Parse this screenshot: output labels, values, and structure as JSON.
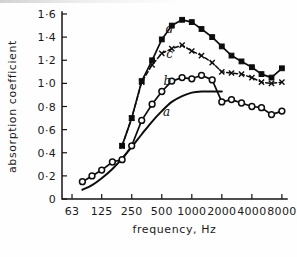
{
  "chart_data": {
    "type": "line",
    "title": "",
    "xlabel": "frequency, Hz",
    "ylabel": "absorption coefficient",
    "xscale": "log",
    "xlim": [
      50,
      9000
    ],
    "ylim": [
      0,
      1.6
    ],
    "grid": false,
    "legend": "inline-curve-labels",
    "xticks": [
      63,
      125,
      250,
      500,
      1000,
      2000,
      4000,
      8000
    ],
    "xticklabels": [
      "63",
      "125",
      "250",
      "500",
      "1000",
      "2000",
      "4000",
      "8000"
    ],
    "yticks": [
      0,
      0.2,
      0.4,
      0.6,
      0.8,
      1.0,
      1.2,
      1.4,
      1.6
    ],
    "yticklabels": [
      "0",
      "0·2",
      "0·4",
      "0·6",
      "0·8",
      "1·0",
      "1·2",
      "1·4",
      "1·6"
    ],
    "series": [
      {
        "name": "a",
        "label": "a",
        "marker": "none",
        "linestyle": "solid-smooth",
        "label_x": 560,
        "label_y": 0.72,
        "x": [
          80,
          100,
          125,
          160,
          200,
          250,
          315,
          400,
          500,
          630,
          800,
          1000,
          1250,
          1600,
          2000
        ],
        "y": [
          0.08,
          0.12,
          0.18,
          0.26,
          0.35,
          0.45,
          0.56,
          0.67,
          0.76,
          0.84,
          0.89,
          0.92,
          0.93,
          0.93,
          0.93
        ]
      },
      {
        "name": "b",
        "label": "b",
        "marker": "circle",
        "linestyle": "solid",
        "label_x": 570,
        "label_y": 0.99,
        "x": [
          80,
          100,
          125,
          160,
          200,
          250,
          315,
          400,
          500,
          630,
          800,
          1000,
          1250,
          1600,
          2000,
          2500,
          3150,
          4000,
          5000,
          6300,
          8000
        ],
        "y": [
          0.15,
          0.2,
          0.25,
          0.32,
          0.34,
          0.46,
          0.68,
          0.82,
          0.93,
          1.02,
          1.05,
          1.04,
          1.07,
          1.03,
          0.84,
          0.86,
          0.83,
          0.8,
          0.79,
          0.73,
          0.76
        ]
      },
      {
        "name": "c",
        "label": "c",
        "marker": "cross",
        "linestyle": "dashed",
        "label_x": 600,
        "label_y": 1.22,
        "x": [
          200,
          250,
          315,
          400,
          500,
          630,
          800,
          1000,
          1250,
          1600,
          2000,
          2500,
          3150,
          4000,
          5000,
          6300,
          8000
        ],
        "y": [
          0.46,
          0.7,
          1.01,
          1.16,
          1.26,
          1.3,
          1.33,
          1.28,
          1.24,
          1.18,
          1.1,
          1.09,
          1.08,
          1.05,
          1.01,
          1.0,
          1.01
        ]
      },
      {
        "name": "d",
        "label": "d",
        "marker": "square",
        "linestyle": "solid",
        "label_x": 600,
        "label_y": 1.44,
        "x": [
          200,
          250,
          315,
          400,
          500,
          630,
          800,
          1000,
          1250,
          1600,
          2000,
          2500,
          3150,
          4000,
          5000,
          6300,
          8000
        ],
        "y": [
          0.46,
          0.7,
          1.02,
          1.2,
          1.38,
          1.5,
          1.55,
          1.53,
          1.47,
          1.4,
          1.32,
          1.24,
          1.19,
          1.14,
          1.08,
          1.05,
          1.13
        ]
      }
    ]
  }
}
